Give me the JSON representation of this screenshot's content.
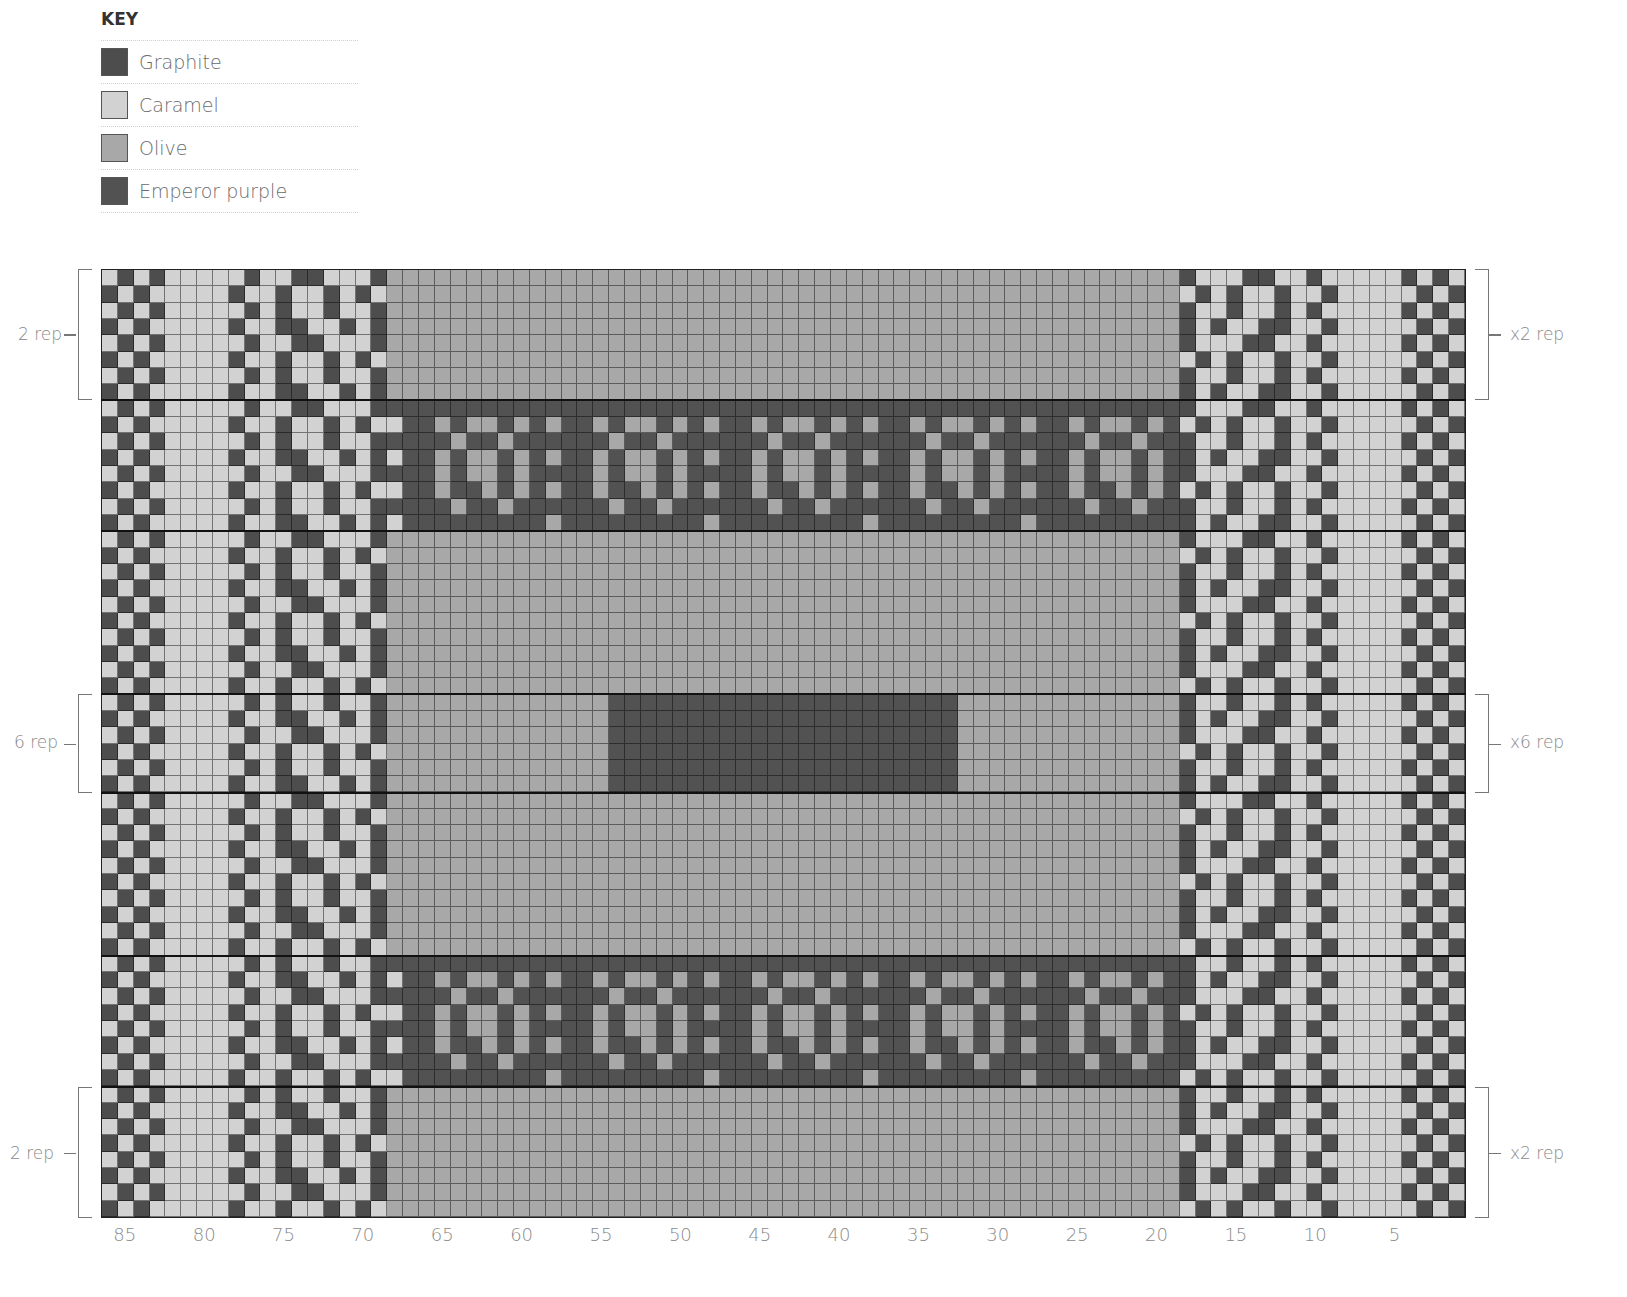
{
  "key": {
    "title": "KEY",
    "items": [
      {
        "id": "G",
        "label": "Graphite",
        "color": "#4d4d4d"
      },
      {
        "id": "C",
        "label": "Caramel",
        "color": "#d2d2d2"
      },
      {
        "id": "O",
        "label": "Olive",
        "color": "#a8a8a8"
      },
      {
        "id": "P",
        "label": "Emperor purple",
        "color": "#525252"
      }
    ]
  },
  "chart_data": {
    "type": "heatmap",
    "columns": 86,
    "rows": 58,
    "xlabel": "stitches (numbered right to left)",
    "x_ticks": [
      85,
      80,
      75,
      70,
      65,
      60,
      55,
      50,
      45,
      40,
      35,
      30,
      25,
      20,
      15,
      10,
      5
    ],
    "sections": [
      {
        "rows": 8,
        "type": "plain",
        "repeat": "x2 rep"
      },
      {
        "rows": 8,
        "type": "motif"
      },
      {
        "rows": 10,
        "type": "plain"
      },
      {
        "rows": 6,
        "type": "center",
        "repeat": "x6 rep"
      },
      {
        "rows": 10,
        "type": "plain"
      },
      {
        "rows": 8,
        "type": "motif"
      },
      {
        "rows": 8,
        "type": "plain",
        "repeat": "x2 rep"
      }
    ],
    "border_cols": 18,
    "olive_cols": [
      18,
      67
    ],
    "center_block_cols": [
      32,
      53
    ],
    "border_pattern": [
      "CGCGCCCCCGCCGGCCCG",
      "GCGCCCCCGCCGCCGCGC",
      "CGCGCCCCCGCGCCGCCG",
      "GCGCCCCCGCCGGCCGCG"
    ],
    "motif_pattern": [
      "PPPPPPPPPP",
      "OPPOPOOPOP",
      "PPPPOPPOPP",
      "OPPOPOOPOP",
      "PPPOPOOPOP",
      "OPPOPPOPOP",
      "PPPPOPPOPP",
      "OPPPPPPPPP"
    ]
  },
  "repeat_labels": {
    "top_left": "2 rep",
    "top_right": "x2 rep",
    "mid_left": "6 rep",
    "mid_right": "x6 rep",
    "bottom_left": "2 rep",
    "bottom_right": "x2 rep"
  }
}
